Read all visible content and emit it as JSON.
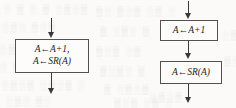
{
  "diagram": {
    "left_flow": {
      "name": "merged-block-flow",
      "box": {
        "name": "merged-assignment-box",
        "lines": [
          "A←A+1,",
          "A←SR(A)"
        ]
      },
      "arrows": {
        "incoming": "arrow-down-into-merged-box",
        "outgoing": "arrow-down-out-of-merged-box"
      }
    },
    "right_flow": {
      "name": "split-block-flow",
      "boxes": [
        {
          "name": "increment-box",
          "lines": [
            "A←A+1"
          ]
        },
        {
          "name": "shift-right-box",
          "lines": [
            "A←SR(A)"
          ]
        }
      ],
      "arrows": {
        "incoming": "arrow-down-into-increment-box",
        "between": "arrow-down-increment-to-shift",
        "outgoing": "arrow-down-out-of-shift-box"
      }
    },
    "background_marks": [
      {
        "text": "░ ▒ ░ ▒  ░▒░▒",
        "left": 4,
        "top": 4
      },
      {
        "text": "▒░ ▒░▒  ░▒ ░",
        "left": 96,
        "top": 6
      },
      {
        "text": "░▒░ ▒░▒",
        "left": 2,
        "top": 22
      },
      {
        "text": "▒ ░▒░ ▒",
        "left": 100,
        "top": 26
      },
      {
        "text": "░▒ ░▒░▒",
        "left": 0,
        "top": 44
      },
      {
        "text": "▒░▒ ░▒",
        "left": 96,
        "top": 46
      },
      {
        "text": "░ ▒░▒ ░▒░",
        "left": 0,
        "top": 62
      },
      {
        "text": "▒░▒░ ▒",
        "left": 100,
        "top": 66
      },
      {
        "text": "░▒░▒ ░▒░▒ ░",
        "left": 2,
        "top": 80
      },
      {
        "text": "▒ ░▒░▒",
        "left": 104,
        "top": 84
      },
      {
        "text": "░▒░ ▒░",
        "left": 6,
        "top": 96
      },
      {
        "text": "▒░▒ ░▒ ░",
        "left": 114,
        "top": 98
      },
      {
        "text": "░▒ ░",
        "left": 222,
        "top": 30
      },
      {
        "text": "▒░▒",
        "left": 224,
        "top": 56
      },
      {
        "text": "░▒░▒",
        "left": 150,
        "top": 92
      }
    ]
  },
  "colors": {
    "background": "#fbfaf8",
    "box_fill": "#fdfcfa",
    "box_border": "#55514c",
    "arrow": "#3a3734",
    "text": "#232323",
    "bleed": "#d9d6d1"
  }
}
